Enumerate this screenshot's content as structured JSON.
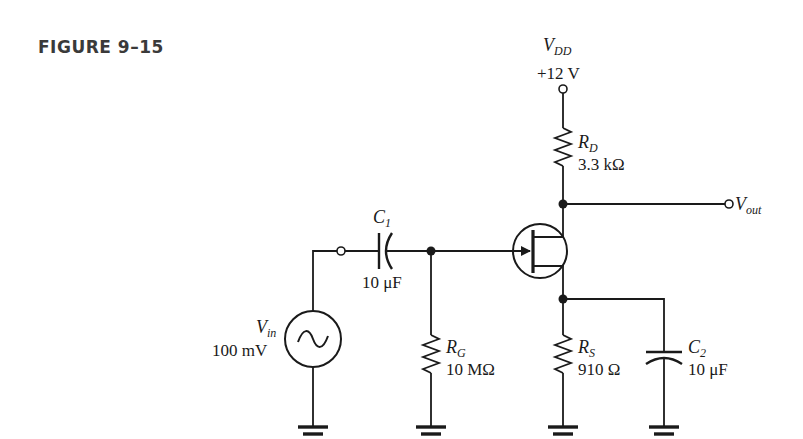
{
  "figure": {
    "label": "FIGURE 9–15"
  },
  "components": {
    "vdd": {
      "symbol": "V",
      "subscript": "DD",
      "value": "+12 V"
    },
    "rd": {
      "symbol": "R",
      "subscript": "D",
      "value": "3.3 kΩ"
    },
    "vout": {
      "symbol": "V",
      "subscript": "out"
    },
    "c1": {
      "symbol": "C",
      "subscript": "1",
      "value": "10 μF"
    },
    "vin": {
      "symbol": "V",
      "subscript": "in",
      "value": "100 mV"
    },
    "rg": {
      "symbol": "R",
      "subscript": "G",
      "value": "10 MΩ"
    },
    "rs": {
      "symbol": "R",
      "subscript": "S",
      "value": "910 Ω"
    },
    "c2": {
      "symbol": "C",
      "subscript": "2",
      "value": "10 μF"
    },
    "jfet": {
      "type": "n-channel JFET"
    }
  },
  "colors": {
    "ink": "#1a1a1a",
    "title": "#3a3a3a",
    "background": "#ffffff"
  }
}
